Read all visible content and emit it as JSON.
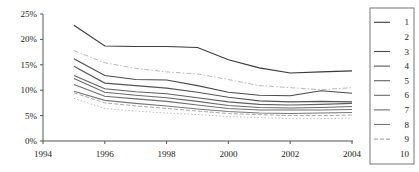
{
  "chart_data": {
    "type": "line",
    "title": "",
    "xlabel": "",
    "ylabel": "",
    "x": [
      1995,
      1996,
      1997,
      1998,
      1999,
      2000,
      2001,
      2002,
      2003,
      2004
    ],
    "xlim": [
      1994,
      2004
    ],
    "ylim": [
      0,
      25
    ],
    "ytick_labels": [
      "0%",
      "5%",
      "10%",
      "15%",
      "20%",
      "25%"
    ],
    "ytick_values": [
      0,
      5,
      10,
      15,
      20,
      25
    ],
    "xtick_labels": [
      "1994",
      "1996",
      "1998",
      "2000",
      "2002",
      "2004"
    ],
    "xtick_values": [
      1994,
      1996,
      1998,
      2000,
      2002,
      2004
    ],
    "grid": false,
    "legend_position": "right",
    "series": [
      {
        "name": "1",
        "style": "solid",
        "color": "#3a3a3a",
        "values": [
          22.8,
          18.7,
          18.6,
          18.6,
          18.4,
          16.0,
          14.4,
          13.4,
          13.6,
          13.8
        ]
      },
      {
        "name": "2",
        "style": "dashdot",
        "color": "#b9b9b9",
        "values": [
          17.8,
          15.4,
          14.3,
          13.6,
          13.2,
          12.1,
          10.9,
          10.5,
          10.1,
          10.5
        ]
      },
      {
        "name": "3",
        "style": "solid",
        "color": "#4a4a4a",
        "values": [
          16.2,
          12.9,
          12.1,
          12.0,
          10.9,
          9.6,
          9.0,
          8.9,
          9.9,
          9.4
        ]
      },
      {
        "name": "4",
        "style": "solid",
        "color": "#555555",
        "values": [
          14.7,
          11.4,
          10.9,
          10.4,
          9.6,
          8.6,
          7.9,
          7.7,
          7.8,
          7.7
        ]
      },
      {
        "name": "5",
        "style": "solid",
        "color": "#606060",
        "values": [
          12.9,
          10.3,
          9.7,
          9.3,
          8.5,
          7.7,
          7.2,
          7.1,
          7.2,
          7.4
        ]
      },
      {
        "name": "6",
        "style": "solid",
        "color": "#6a6a6a",
        "values": [
          12.3,
          9.6,
          9.0,
          8.5,
          7.8,
          7.0,
          6.6,
          6.5,
          6.6,
          6.8
        ]
      },
      {
        "name": "7",
        "style": "solid",
        "color": "#6f6f6f",
        "values": [
          11.1,
          8.8,
          8.3,
          7.8,
          7.1,
          6.4,
          6.1,
          6.1,
          6.1,
          6.2
        ]
      },
      {
        "name": "8",
        "style": "solid",
        "color": "#787878",
        "values": [
          9.8,
          8.0,
          7.4,
          6.9,
          6.3,
          5.8,
          5.5,
          5.4,
          5.5,
          5.6
        ]
      },
      {
        "name": "9",
        "style": "dashed",
        "color": "#a8a8a8",
        "values": [
          9.5,
          7.5,
          6.9,
          6.4,
          5.9,
          5.4,
          5.2,
          5.0,
          5.0,
          5.1
        ]
      },
      {
        "name": "10",
        "style": "dotted",
        "color": "#bdbdbd",
        "values": [
          8.4,
          6.4,
          5.9,
          5.5,
          5.2,
          4.8,
          4.6,
          4.4,
          4.4,
          4.5
        ]
      }
    ],
    "legend_entries": [
      {
        "label": "1",
        "style": "solid"
      },
      {
        "label": "2",
        "style": "none"
      },
      {
        "label": "3",
        "style": "solid"
      },
      {
        "label": "4",
        "style": "solid"
      },
      {
        "label": "5",
        "style": "solid"
      },
      {
        "label": "6",
        "style": "solid"
      },
      {
        "label": "7",
        "style": "solid"
      },
      {
        "label": "8",
        "style": "solid"
      },
      {
        "label": "9",
        "style": "dashed"
      },
      {
        "label": "10",
        "style": "none"
      }
    ]
  }
}
